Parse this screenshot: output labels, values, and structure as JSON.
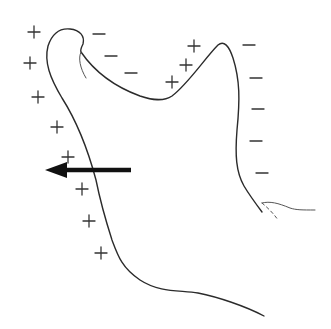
{
  "figure": {
    "colors": {
      "stroke": "#2b2b2b",
      "arrow": "#111111",
      "background": "#ffffff"
    },
    "plus_signs": [
      {
        "x": 34,
        "y": 32
      },
      {
        "x": 30,
        "y": 63
      },
      {
        "x": 38,
        "y": 97
      },
      {
        "x": 57,
        "y": 127
      },
      {
        "x": 68,
        "y": 157
      },
      {
        "x": 82,
        "y": 189
      },
      {
        "x": 89,
        "y": 221
      },
      {
        "x": 101,
        "y": 253
      },
      {
        "x": 194,
        "y": 46
      },
      {
        "x": 186,
        "y": 65
      },
      {
        "x": 172,
        "y": 82
      }
    ],
    "minus_signs": [
      {
        "x": 99,
        "y": 34
      },
      {
        "x": 111,
        "y": 56
      },
      {
        "x": 131,
        "y": 73
      },
      {
        "x": 249,
        "y": 45
      },
      {
        "x": 256,
        "y": 78
      },
      {
        "x": 258,
        "y": 109
      },
      {
        "x": 256,
        "y": 141
      },
      {
        "x": 262,
        "y": 173
      }
    ],
    "arrow": {
      "from": {
        "x": 131,
        "y": 170
      },
      "to": {
        "x": 46,
        "y": 170
      },
      "direction": "left"
    }
  }
}
